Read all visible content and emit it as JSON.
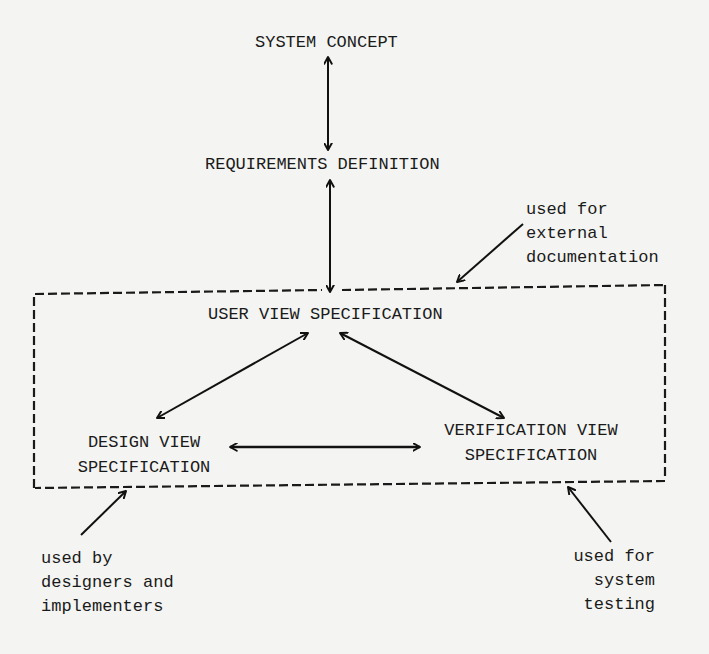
{
  "diagram": {
    "type": "flow",
    "nodes": {
      "system_concept": {
        "label": "SYSTEM CONCEPT"
      },
      "requirements_definition": {
        "label": "REQUIREMENTS DEFINITION"
      },
      "user_view_spec": {
        "label": "USER VIEW SPECIFICATION"
      },
      "design_view_spec": {
        "line1": "DESIGN VIEW",
        "line2": "SPECIFICATION"
      },
      "verification_view_spec": {
        "line1": "VERIFICATION VIEW",
        "line2": "SPECIFICATION"
      }
    },
    "edges": [
      {
        "from": "system_concept",
        "to": "requirements_definition",
        "style": "bidirectional"
      },
      {
        "from": "requirements_definition",
        "to": "user_view_spec",
        "style": "bidirectional"
      },
      {
        "from": "user_view_spec",
        "to": "design_view_spec",
        "style": "bidirectional"
      },
      {
        "from": "user_view_spec",
        "to": "verification_view_spec",
        "style": "bidirectional"
      },
      {
        "from": "design_view_spec",
        "to": "verification_view_spec",
        "style": "bidirectional"
      }
    ],
    "group": {
      "style": "dashed",
      "members": [
        "user_view_spec",
        "design_view_spec",
        "verification_view_spec"
      ]
    },
    "annotations": {
      "external_doc": {
        "line1": "used for",
        "line2": "external",
        "line3": "documentation",
        "points_to": "group-top"
      },
      "designers": {
        "line1": "used by",
        "line2": "designers and",
        "line3": "implementers",
        "points_to": "group-bottom-left"
      },
      "system_testing": {
        "line1": "used for",
        "line2": "system",
        "line3": "testing",
        "points_to": "group-bottom-right"
      }
    }
  }
}
